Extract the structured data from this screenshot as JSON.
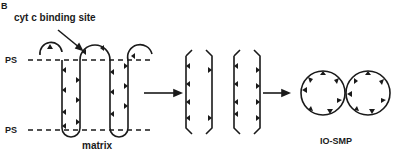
{
  "panel_label": "B",
  "labels": {
    "binding_site": "cyt  c binding site",
    "ps_top": "PS",
    "ps_bottom": "PS",
    "matrix": "matrix",
    "io_smp": "IO-SMP"
  },
  "colors": {
    "stroke": "#1a1a1a",
    "background": "#ffffff"
  }
}
